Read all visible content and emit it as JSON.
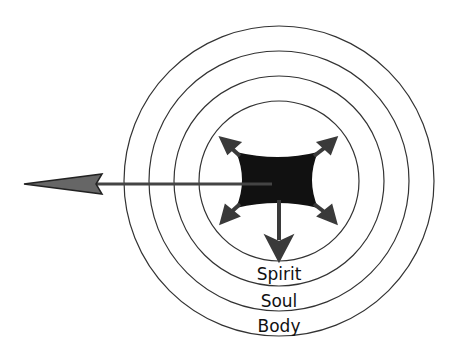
{
  "diagram": {
    "type": "concentric-circles",
    "rings": [
      {
        "label": "Spirit",
        "radius": 105
      },
      {
        "label": "Soul",
        "radius": 130
      },
      {
        "label": "Body",
        "radius": 155
      }
    ],
    "inner_circle_radius": 80,
    "center_shape": "concave-square",
    "arrows": [
      "up-left",
      "up-right",
      "down-left",
      "down-right",
      "down",
      "left-long"
    ],
    "colors": {
      "stroke": "#333333",
      "fill": "#111111",
      "arrow": "#3a3a3a",
      "background": "#ffffff"
    }
  }
}
